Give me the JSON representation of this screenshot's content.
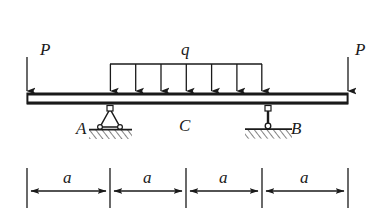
{
  "figure": {
    "type": "statics-beam-free-body-diagram",
    "background_color": "#ffffff",
    "line_color": "#1a1a1a",
    "labels": {
      "load_left": "P",
      "load_right": "P",
      "distributed_load": "q",
      "support_a": "A",
      "support_b": "B",
      "point_c": "C",
      "dim_1": "a",
      "dim_2": "a",
      "dim_3": "a",
      "dim_4": "a"
    },
    "beam": {
      "x_start": 27,
      "x_end": 348,
      "y_top": 93,
      "y_bottom": 104
    },
    "point_loads": [
      {
        "name": "P-left",
        "x": 27,
        "y_start": 58,
        "y_end": 92,
        "direction": "down"
      },
      {
        "name": "P-right",
        "x": 348,
        "y_start": 58,
        "y_end": 92,
        "direction": "down"
      }
    ],
    "distributed_load": {
      "x_start": 110,
      "x_end": 262,
      "y_rail": 64,
      "y_tip": 92,
      "arrow_count": 7,
      "arrow_x": [
        110,
        135,
        160,
        186,
        211,
        236,
        262
      ]
    },
    "supports": [
      {
        "name": "A",
        "kind": "pinned-triangle",
        "x": 110,
        "label_x": 80,
        "label_y": 133
      },
      {
        "name": "B",
        "kind": "link-rod",
        "x": 268,
        "label_x": 290,
        "label_y": 133
      }
    ],
    "points": [
      {
        "name": "C",
        "x": 186,
        "label_x": 180,
        "label_y": 130
      }
    ],
    "dimension_line": {
      "y_axis": 191,
      "y_tick_top": 168,
      "y_tick_bottom": 208,
      "label_y": 181,
      "ticks": [
        27,
        110,
        186,
        262,
        348
      ],
      "segments": [
        {
          "label": "a",
          "x_from": 27,
          "x_to": 110,
          "label_x": 68
        },
        {
          "label": "a",
          "x_from": 110,
          "x_to": 186,
          "label_x": 148
        },
        {
          "label": "a",
          "x_from": 186,
          "x_to": 262,
          "label_x": 224
        },
        {
          "label": "a",
          "x_from": 262,
          "x_to": 348,
          "label_x": 305
        }
      ]
    }
  }
}
